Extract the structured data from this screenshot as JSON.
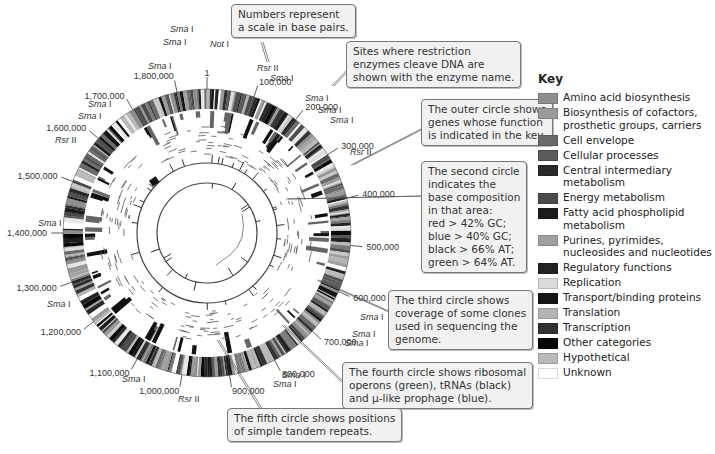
{
  "figure": {
    "type": "circular genome map (grayscale)",
    "center": [
      207,
      233
    ],
    "rings": {
      "gene_ring_outer_r": 144,
      "gene_ring_inner_r": 124,
      "second_circle_r": 70,
      "third_circle_r": 50
    }
  },
  "scale_labels": [
    {
      "text": "1",
      "angle": 0
    },
    {
      "text": "100,000",
      "angle": 19
    },
    {
      "text": "200,000",
      "angle": 38
    },
    {
      "text": "300,000",
      "angle": 57
    },
    {
      "text": "400,000",
      "angle": 76
    },
    {
      "text": "500,000",
      "angle": 95
    },
    {
      "text": "600,000",
      "angle": 114
    },
    {
      "text": "700,000",
      "angle": 133
    },
    {
      "text": "800,000",
      "angle": 152
    },
    {
      "text": "900,000",
      "angle": 171
    },
    {
      "text": "1,000,000",
      "angle": 190
    },
    {
      "text": "1,100,000",
      "angle": 209
    },
    {
      "text": "1,200,000",
      "angle": 232
    },
    {
      "text": "1,300,000",
      "angle": 250
    },
    {
      "text": "1,400,000",
      "angle": 270
    },
    {
      "text": "1,500,000",
      "angle": 291
    },
    {
      "text": "1,600,000",
      "angle": 311
    },
    {
      "text": "1,700,000",
      "angle": 329
    },
    {
      "text": "1,800,000",
      "angle": 348
    }
  ],
  "enzyme_sites": [
    {
      "name": "Sma",
      "suffix": "I",
      "label_pos": [
        170,
        32
      ]
    },
    {
      "name": "Sma",
      "suffix": "I",
      "label_pos": [
        163,
        45
      ]
    },
    {
      "name": "Not",
      "suffix": "I",
      "label_pos": [
        210,
        47
      ]
    },
    {
      "name": "Sma",
      "suffix": "I",
      "label_pos": [
        148,
        69
      ]
    },
    {
      "name": "Rsr",
      "suffix": "II",
      "label_pos": [
        257,
        71
      ]
    },
    {
      "name": "Sma",
      "suffix": "I",
      "label_pos": [
        270,
        81
      ]
    },
    {
      "name": "Sma",
      "suffix": "I",
      "label_pos": [
        88,
        107
      ]
    },
    {
      "name": "Sma",
      "suffix": "I",
      "label_pos": [
        78,
        119
      ]
    },
    {
      "name": "Rsr",
      "suffix": "II",
      "label_pos": [
        55,
        143
      ]
    },
    {
      "name": "Sma",
      "suffix": "I",
      "label_pos": [
        305,
        101
      ]
    },
    {
      "name": "Sma",
      "suffix": "I",
      "label_pos": [
        318,
        113
      ]
    },
    {
      "name": "Sma",
      "suffix": "I",
      "label_pos": [
        330,
        123
      ]
    },
    {
      "name": "Rsr",
      "suffix": "II",
      "label_pos": [
        350,
        155
      ]
    },
    {
      "name": "Sma",
      "suffix": "I",
      "label_pos": [
        38,
        226
      ]
    },
    {
      "name": "Sma",
      "suffix": "I",
      "label_pos": [
        47,
        307
      ]
    },
    {
      "name": "Sma",
      "suffix": "I",
      "label_pos": [
        360,
        320
      ]
    },
    {
      "name": "Sma",
      "suffix": "I",
      "label_pos": [
        352,
        337
      ]
    },
    {
      "name": "Sma",
      "suffix": "I",
      "label_pos": [
        345,
        346
      ]
    },
    {
      "name": "Sma",
      "suffix": "I",
      "label_pos": [
        282,
        378
      ]
    },
    {
      "name": "Sma",
      "suffix": "I",
      "label_pos": [
        273,
        387
      ]
    },
    {
      "name": "Sma",
      "suffix": "I",
      "label_pos": [
        122,
        382
      ]
    },
    {
      "name": "Rsr",
      "suffix": "II",
      "label_pos": [
        178,
        402
      ]
    }
  ],
  "callouts": [
    {
      "id": "scale",
      "text": "Numbers represent\na scale in base pairs."
    },
    {
      "id": "enzymes",
      "text": "Sites where restriction\nenzymes cleave DNA are\nshown with the enzyme name."
    },
    {
      "id": "outer-circle",
      "text": "The outer circle shows\ngenes whose function\nis indicated in the key."
    },
    {
      "id": "second-circle",
      "text": "The second circle\nindicates the\nbase composition\nin that area:\nred > 42% GC;\nblue > 40% GC;\nblack > 66% AT;\ngreen > 64% AT."
    },
    {
      "id": "third-circle",
      "text": "The third circle shows\ncoverage of some clones\nused in sequencing the\ngenome."
    },
    {
      "id": "fourth-circle",
      "text": "The fourth circle shows ribosomal\noperons (green), tRNAs (black)\nand μ-like prophage (blue)."
    },
    {
      "id": "fifth-circle",
      "text": "The fifth circle shows positions\nof simple tandem repeats."
    }
  ],
  "key": {
    "title": "Key",
    "items": [
      {
        "label": "Amino acid biosynthesis",
        "color": "#8e8e8e"
      },
      {
        "label": "Biosynthesis of cofactors,\n    prosthetic groups, carriers",
        "color": "#9a9a9a"
      },
      {
        "label": "Cell envelope",
        "color": "#6a6a6a"
      },
      {
        "label": "Cellular processes",
        "color": "#5a5a5a"
      },
      {
        "label": "Central intermediary metabolism",
        "color": "#2a2a2a"
      },
      {
        "label": "Energy metabolism",
        "color": "#4a4a4a"
      },
      {
        "label": "Fatty acid phospholipid metabolism",
        "color": "#1c1c1c"
      },
      {
        "label": "Purines, pyrimides,\n    nucleosides and nucleotides",
        "color": "#a0a0a0"
      },
      {
        "label": "Regulatory functions",
        "color": "#222222"
      },
      {
        "label": "Replication",
        "color": "#dcdcdc"
      },
      {
        "label": "Transport/binding proteins",
        "color": "#151515"
      },
      {
        "label": "Translation",
        "color": "#b4b4b4"
      },
      {
        "label": "Transcription",
        "color": "#333333"
      },
      {
        "label": "Other categories",
        "color": "#080808"
      },
      {
        "label": "Hypothetical",
        "color": "#b9b9b9"
      },
      {
        "label": "Unknown",
        "color": "#ffffff"
      }
    ]
  }
}
